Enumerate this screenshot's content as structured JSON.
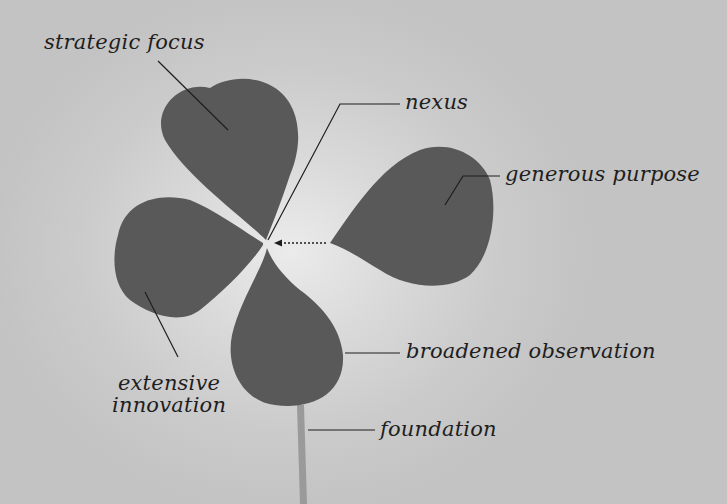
{
  "diagram": {
    "colors": {
      "leaf": "#5a5a5a",
      "stem": "#9a9a9a",
      "background": "#c8c8c8",
      "halo": "#ebebeb",
      "line": "#1e1e1e"
    },
    "labels": {
      "strategic_focus": "strategic focus",
      "nexus": "nexus",
      "generous_purpose": "generous purpose",
      "extensive_innovation_line1": "extensive",
      "extensive_innovation_line2": "innovation",
      "broadened_observation": "broadened observation",
      "foundation": "foundation"
    }
  }
}
